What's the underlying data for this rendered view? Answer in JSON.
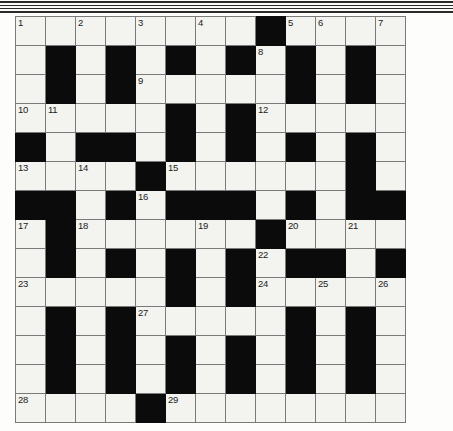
{
  "page": {
    "type": "crossword-puzzle-grid",
    "columns": 13,
    "rows": 14,
    "cell_fill_color": "#f3f3ef",
    "block_color": "#0b0b0b",
    "grid_line_color": "#7a7a7a",
    "decorative_rule_color": "#2b2b2b"
  },
  "decorative_rules": [
    {
      "top": 1,
      "height": 2
    },
    {
      "top": 5,
      "height": 1
    },
    {
      "top": 8,
      "height": 1
    },
    {
      "top": 11,
      "height": 2
    }
  ],
  "grid": {
    "legend": {
      "0": "white-cell",
      "1": "black-block"
    },
    "rows": [
      [
        0,
        0,
        0,
        0,
        0,
        0,
        0,
        0,
        1,
        0,
        0,
        0,
        0
      ],
      [
        0,
        1,
        0,
        1,
        0,
        1,
        0,
        1,
        0,
        1,
        0,
        1,
        0
      ],
      [
        0,
        1,
        0,
        1,
        0,
        0,
        0,
        0,
        0,
        1,
        0,
        1,
        0
      ],
      [
        0,
        0,
        0,
        0,
        0,
        1,
        0,
        1,
        0,
        0,
        0,
        0,
        0
      ],
      [
        1,
        0,
        1,
        1,
        0,
        1,
        0,
        1,
        0,
        1,
        0,
        1,
        0
      ],
      [
        0,
        0,
        0,
        0,
        1,
        0,
        0,
        0,
        0,
        0,
        0,
        1,
        0
      ],
      [
        1,
        1,
        0,
        1,
        0,
        1,
        1,
        1,
        0,
        1,
        0,
        1,
        1
      ],
      [
        0,
        1,
        0,
        0,
        0,
        0,
        0,
        0,
        1,
        0,
        0,
        0,
        0
      ],
      [
        0,
        1,
        0,
        1,
        0,
        1,
        0,
        1,
        0,
        1,
        1,
        0,
        1
      ],
      [
        0,
        0,
        0,
        0,
        0,
        1,
        0,
        1,
        0,
        0,
        0,
        0,
        0
      ],
      [
        0,
        1,
        0,
        1,
        0,
        0,
        0,
        0,
        0,
        1,
        0,
        1,
        0
      ],
      [
        0,
        1,
        0,
        1,
        0,
        1,
        0,
        1,
        0,
        1,
        0,
        1,
        0
      ],
      [
        0,
        1,
        0,
        1,
        0,
        1,
        0,
        1,
        0,
        1,
        0,
        1,
        0
      ],
      [
        0,
        0,
        0,
        0,
        1,
        0,
        0,
        0,
        0,
        0,
        0,
        0,
        0
      ]
    ]
  },
  "clue_numbers": [
    {
      "number": "1",
      "row": 0,
      "col": 0
    },
    {
      "number": "2",
      "row": 0,
      "col": 2
    },
    {
      "number": "3",
      "row": 0,
      "col": 4
    },
    {
      "number": "4",
      "row": 0,
      "col": 6
    },
    {
      "number": "5",
      "row": 0,
      "col": 9
    },
    {
      "number": "6",
      "row": 0,
      "col": 10
    },
    {
      "number": "7",
      "row": 0,
      "col": 12
    },
    {
      "number": "8",
      "row": 1,
      "col": 8
    },
    {
      "number": "9",
      "row": 2,
      "col": 4
    },
    {
      "number": "10",
      "row": 3,
      "col": 0
    },
    {
      "number": "11",
      "row": 3,
      "col": 1
    },
    {
      "number": "12",
      "row": 3,
      "col": 8
    },
    {
      "number": "13",
      "row": 5,
      "col": 0
    },
    {
      "number": "14",
      "row": 5,
      "col": 2
    },
    {
      "number": "15",
      "row": 5,
      "col": 5
    },
    {
      "number": "16",
      "row": 6,
      "col": 4
    },
    {
      "number": "17",
      "row": 7,
      "col": 0
    },
    {
      "number": "18",
      "row": 7,
      "col": 2
    },
    {
      "number": "19",
      "row": 7,
      "col": 6
    },
    {
      "number": "20",
      "row": 7,
      "col": 9
    },
    {
      "number": "21",
      "row": 7,
      "col": 11
    },
    {
      "number": "22",
      "row": 8,
      "col": 8
    },
    {
      "number": "23",
      "row": 9,
      "col": 0
    },
    {
      "number": "24",
      "row": 9,
      "col": 8
    },
    {
      "number": "25",
      "row": 9,
      "col": 10
    },
    {
      "number": "26",
      "row": 9,
      "col": 12
    },
    {
      "number": "27",
      "row": 10,
      "col": 4
    },
    {
      "number": "28",
      "row": 13,
      "col": 0
    },
    {
      "number": "29",
      "row": 13,
      "col": 5
    }
  ],
  "entered_letters": []
}
